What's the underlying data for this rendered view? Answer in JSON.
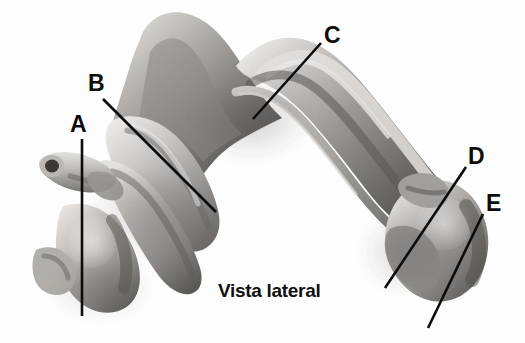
{
  "figure": {
    "kind": "anatomical-illustration",
    "style": "grayscale-halftone-drawing",
    "background_color": "#fdfdfd",
    "ink_color": "#0c0c0c",
    "tones": {
      "lightest": "#f2f0ee",
      "light": "#d8d5d2",
      "mid": "#a8a5a2",
      "dark": "#6e6b69",
      "darkest": "#3a3836"
    },
    "caption": "Vista lateral"
  },
  "labels": [
    {
      "id": "A",
      "text": "A",
      "text_x": 70,
      "text_y": 113,
      "leader": {
        "x1": 82,
        "y1": 139,
        "x2": 82,
        "y2": 316
      }
    },
    {
      "id": "B",
      "text": "B",
      "text_x": 88,
      "text_y": 72,
      "leader": {
        "x1": 103,
        "y1": 99,
        "x2": 216,
        "y2": 212
      }
    },
    {
      "id": "C",
      "text": "C",
      "text_x": 324,
      "text_y": 24,
      "leader": {
        "x1": 321,
        "y1": 43,
        "x2": 253,
        "y2": 119
      }
    },
    {
      "id": "D",
      "text": "D",
      "text_x": 468,
      "text_y": 145,
      "leader": {
        "x1": 466,
        "y1": 167,
        "x2": 385,
        "y2": 288
      }
    },
    {
      "id": "E",
      "text": "E",
      "text_x": 486,
      "text_y": 192,
      "leader": {
        "x1": 483,
        "y1": 214,
        "x2": 428,
        "y2": 328
      }
    }
  ],
  "caption_block": {
    "text": "Vista lateral",
    "x": 218,
    "y": 281
  }
}
